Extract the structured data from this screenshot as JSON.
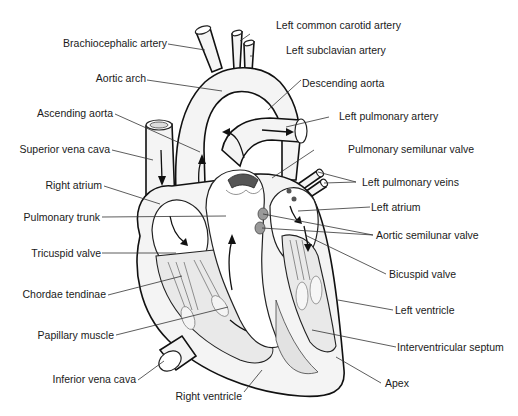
{
  "diagram": {
    "labels": {
      "left_common_carotid_artery": "Left common carotid artery",
      "brachiocephalic_artery": "Brachiocephalic artery",
      "left_subclavian_artery": "Left subclavian artery",
      "aortic_arch": "Aortic arch",
      "descending_aorta": "Descending aorta",
      "ascending_aorta": "Ascending aorta",
      "left_pulmonary_artery": "Left pulmonary artery",
      "superior_vena_cava": "Superior vena cava",
      "pulmonary_semilunar_valve": "Pulmonary semilunar valve",
      "right_atrium": "Right atrium",
      "left_pulmonary_veins": "Left pulmonary veins",
      "left_atrium": "Left atrium",
      "pulmonary_trunk": "Pulmonary trunk",
      "aortic_semilunar_valve": "Aortic semilunar valve",
      "tricuspid_valve": "Tricuspid valve",
      "bicuspid_valve": "Bicuspid valve",
      "chordae_tendinae": "Chordae tendinae",
      "left_ventricle": "Left ventricle",
      "papillary_muscle": "Papillary muscle",
      "interventricular_septum": "Interventricular septum",
      "inferior_vena_cava": "Inferior vena cava",
      "apex": "Apex",
      "right_ventricle": "Right ventricle"
    }
  }
}
